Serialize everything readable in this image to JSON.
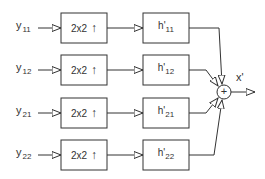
{
  "diagram": {
    "type": "polyphase-synthesis-filterbank",
    "inputs": [
      {
        "name": "y",
        "sub": "11"
      },
      {
        "name": "y",
        "sub": "12"
      },
      {
        "name": "y",
        "sub": "21"
      },
      {
        "name": "y",
        "sub": "22"
      }
    ],
    "upsamplers": [
      {
        "label": "2x2",
        "arrow": "↑"
      },
      {
        "label": "2x2",
        "arrow": "↑"
      },
      {
        "label": "2x2",
        "arrow": "↑"
      },
      {
        "label": "2x2",
        "arrow": "↑"
      }
    ],
    "filters": [
      {
        "name": "h'",
        "sub": "11"
      },
      {
        "name": "h'",
        "sub": "12"
      },
      {
        "name": "h'",
        "sub": "21"
      },
      {
        "name": "h'",
        "sub": "22"
      }
    ],
    "summer": {
      "symbol": "+"
    },
    "output": {
      "label": "x'"
    },
    "colors": {
      "stroke": "#333333",
      "background": "#ffffff"
    }
  }
}
